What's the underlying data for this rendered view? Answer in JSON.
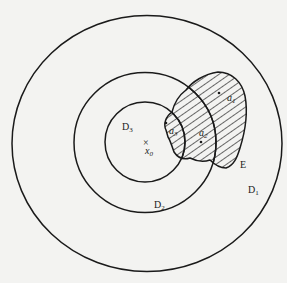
{
  "figure": {
    "background": "#f3f3f1",
    "stroke_color": "#1a1a1a",
    "regions": [
      {
        "id": "D1",
        "label": "D",
        "subscript": "1",
        "shape": "ellipse",
        "cx": 147,
        "cy": 143.5,
        "rx": 135,
        "ry": 128
      },
      {
        "id": "D2",
        "label": "D",
        "subscript": "2",
        "shape": "ellipse",
        "cx": 145,
        "cy": 142.5,
        "rx": 71,
        "ry": 70
      },
      {
        "id": "D3",
        "label": "D",
        "subscript": "3",
        "shape": "ellipse",
        "cx": 145,
        "cy": 142,
        "rx": 40,
        "ry": 40
      }
    ],
    "labels": {
      "D1": {
        "main": "D",
        "sub": "1"
      },
      "D2": {
        "main": "D",
        "sub": "2"
      },
      "D3": {
        "main": "D",
        "sub": "3"
      },
      "E": "E",
      "x0": {
        "main": "x",
        "sub": "0"
      },
      "a1": {
        "main": "a",
        "sub": "1"
      },
      "a2": {
        "main": "a",
        "sub": "2"
      },
      "a3": {
        "main": "a",
        "sub": "3"
      }
    },
    "center_marker": "×",
    "shaded_region": {
      "label": "E",
      "fill": "hatched"
    }
  }
}
